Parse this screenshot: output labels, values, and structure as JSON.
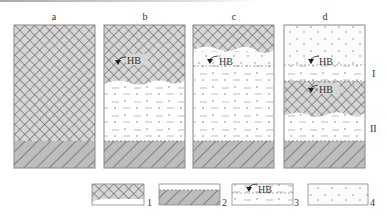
{
  "figure": {
    "panels": [
      {
        "id": "a",
        "label": "a"
      },
      {
        "id": "b",
        "label": "b",
        "marker": "HB"
      },
      {
        "id": "c",
        "label": "c",
        "marker": "HB"
      },
      {
        "id": "d",
        "label": "d",
        "markers": [
          "HB",
          "HB"
        ]
      }
    ],
    "zone_labels": {
      "upper": "I",
      "lower": "II"
    },
    "legend": [
      {
        "num": "1",
        "pattern": "cross-hatch"
      },
      {
        "num": "2",
        "pattern": "diagonal-hatch"
      },
      {
        "num": "3",
        "pattern": "water-table",
        "marker": "HB"
      },
      {
        "num": "4",
        "pattern": "dotted"
      }
    ]
  },
  "colors": {
    "crosshatch_fill": "#d4d4d4",
    "crosshatch_line": "#6e6e6e",
    "diag_fill": "#bcbcbc",
    "diag_line": "#555555",
    "border": "#888888"
  }
}
